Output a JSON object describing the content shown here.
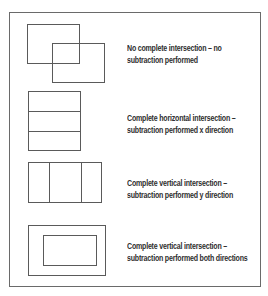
{
  "diagram": {
    "frame": {
      "x": 9,
      "y": 12,
      "width": 252,
      "height": 275
    },
    "line_color": "#5a5a5a",
    "text_color": "#2e2e2e",
    "cases": [
      {
        "id": "no-intersection",
        "caption_lines": [
          "No complete intersection – no",
          "subtraction performed"
        ],
        "caption_top": 42
      },
      {
        "id": "horizontal-intersection",
        "caption_lines": [
          "Complete horizontal intersection –",
          "subtraction performed x direction"
        ],
        "caption_top": 112
      },
      {
        "id": "vertical-intersection",
        "caption_lines": [
          "Complete vertical intersection –",
          "subtraction performed y direction"
        ],
        "caption_top": 177
      },
      {
        "id": "both-directions",
        "caption_lines": [
          "Complete vertical intersection –",
          "subtraction performed both directions"
        ],
        "caption_top": 240
      }
    ]
  }
}
